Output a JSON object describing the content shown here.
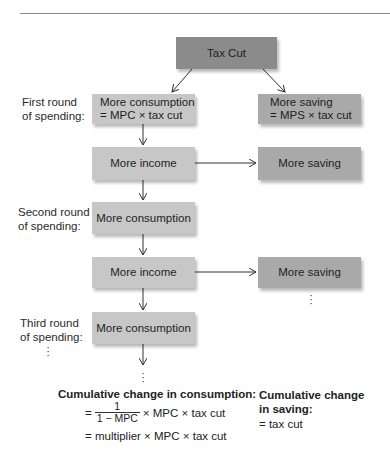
{
  "diagram": {
    "top_node": {
      "label": "Tax Cut"
    },
    "rounds": [
      {
        "label_line1": "First round",
        "label_line2": "of spending:",
        "consumption": {
          "line1": "More consumption",
          "line2": "= MPC × tax cut"
        },
        "saving": {
          "line1": "More saving",
          "line2": "= MPS × tax cut"
        }
      },
      {
        "label_line1": "Second round",
        "label_line2": "of spending:",
        "income": "More income",
        "saving": "More saving",
        "consumption": "More consumption"
      },
      {
        "label_line1": "Third round",
        "label_line2": "of spending:",
        "income": "More income",
        "saving": "More saving",
        "consumption": "More consumption"
      }
    ],
    "continuation": "⋮"
  },
  "summary": {
    "consumption": {
      "title": "Cumulative change in consumption:",
      "eq1_prefix": "=",
      "frac_num": "1",
      "frac_den": "1 − MPC",
      "eq1_suffix": "× MPC × tax cut",
      "eq2": "= multiplier × MPC × tax cut"
    },
    "saving": {
      "title_line1": "Cumulative change",
      "title_line2": "in saving:",
      "eq": "= tax cut"
    }
  },
  "colors": {
    "top_node": "#8b8b8b",
    "consumption_income": "#c7c7c7",
    "saving": "#a9a9a9",
    "rule": "#8d8d8d"
  }
}
